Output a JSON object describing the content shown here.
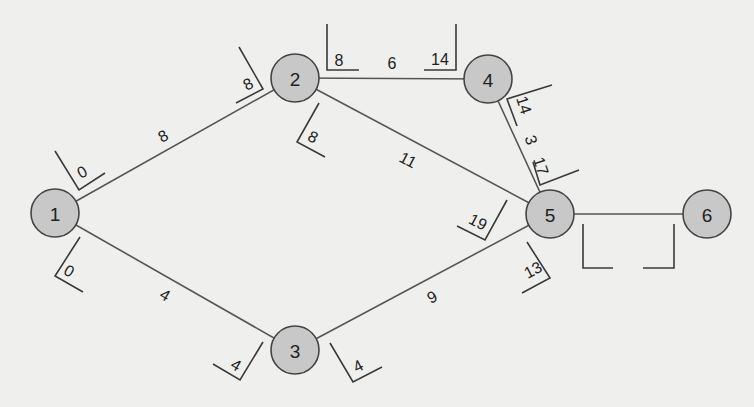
{
  "diagram": {
    "type": "activity-on-node network (critical path)",
    "nodes": [
      {
        "id": "1",
        "label": "1",
        "x": 55,
        "y": 213
      },
      {
        "id": "2",
        "label": "2",
        "x": 295,
        "y": 78
      },
      {
        "id": "3",
        "label": "3",
        "x": 295,
        "y": 350
      },
      {
        "id": "4",
        "label": "4",
        "x": 488,
        "y": 79
      },
      {
        "id": "5",
        "label": "5",
        "x": 550,
        "y": 214
      },
      {
        "id": "6",
        "label": "6",
        "x": 707,
        "y": 214
      }
    ],
    "edges": [
      {
        "from": "1",
        "to": "2",
        "duration": "8",
        "label_x": 163,
        "label_y": 136,
        "rotate": -28
      },
      {
        "from": "1",
        "to": "3",
        "duration": "4",
        "label_x": 165,
        "label_y": 295,
        "rotate": 30
      },
      {
        "from": "2",
        "to": "4",
        "duration": "6",
        "label_x": 392,
        "label_y": 63,
        "rotate": 0
      },
      {
        "from": "2",
        "to": "5",
        "duration": "11",
        "label_x": 408,
        "label_y": 160,
        "rotate": 28
      },
      {
        "from": "3",
        "to": "5",
        "duration": "9",
        "label_x": 432,
        "label_y": 297,
        "rotate": -28
      },
      {
        "from": "4",
        "to": "5",
        "duration": "3",
        "label_x": 531,
        "label_y": 140,
        "rotate": 72
      },
      {
        "from": "5",
        "to": "6",
        "duration": "",
        "label_x": 628,
        "label_y": 200,
        "rotate": 0
      }
    ],
    "time_boxes": [
      {
        "edge": "1-2",
        "end": "start",
        "value": "0",
        "x": 82,
        "y": 172,
        "rotate": -28,
        "path": "55,151 79,190 105,173"
      },
      {
        "edge": "1-2",
        "end": "finish",
        "value": "8",
        "x": 248,
        "y": 84,
        "rotate": -28,
        "path": "239,47 263,89 236,103"
      },
      {
        "edge": "1-3",
        "end": "start",
        "value": "0",
        "x": 69,
        "y": 271,
        "rotate": 30,
        "path": "80,237 55,276 83,292"
      },
      {
        "edge": "1-3",
        "end": "finish",
        "value": "4",
        "x": 236,
        "y": 365,
        "rotate": 30,
        "path": "263,342 240,380 213,364"
      },
      {
        "edge": "2-4",
        "end": "start",
        "value": "8",
        "x": 339,
        "y": 60,
        "rotate": 0,
        "path": "327,24 327,70 359,70"
      },
      {
        "edge": "2-4",
        "end": "finish",
        "value": "14",
        "x": 440,
        "y": 59,
        "rotate": 0,
        "path": "456,24 456,70 424,70"
      },
      {
        "edge": "2-5",
        "end": "start",
        "value": "8",
        "x": 313,
        "y": 137,
        "rotate": 28,
        "path": "319,103 297,142 325,157"
      },
      {
        "edge": "2-5",
        "end": "finish",
        "value": "19",
        "x": 478,
        "y": 222,
        "rotate": 28,
        "path": "507,200 485,240 457,226"
      },
      {
        "edge": "4-5",
        "end": "start",
        "value": "14",
        "x": 524,
        "y": 105,
        "rotate": 72,
        "path": "552,85 507,99 517,126"
      },
      {
        "edge": "4-5",
        "end": "finish",
        "value": "17",
        "x": 541,
        "y": 166,
        "rotate": 72,
        "path": "533,162 540,185 579,170"
      },
      {
        "edge": "3-5",
        "end": "start",
        "value": "4",
        "x": 358,
        "y": 366,
        "rotate": -28,
        "path": "330,343 353,382 382,367"
      },
      {
        "edge": "3-5",
        "end": "finish",
        "value": "13",
        "x": 533,
        "y": 270,
        "rotate": -28,
        "path": "527,242 550,278 522,293"
      },
      {
        "edge": "5-6",
        "end": "start",
        "value": "",
        "x": 598,
        "y": 252,
        "rotate": 0,
        "path": "583,224 583,268 613,268"
      },
      {
        "edge": "5-6",
        "end": "finish",
        "value": "",
        "x": 658,
        "y": 252,
        "rotate": 0,
        "path": "674,224 674,268 643,268"
      }
    ]
  },
  "colors": {
    "background": "#efefed",
    "node_fill": "#c8c8c8",
    "node_stroke": "#444444",
    "line": "#555555",
    "text": "#222222"
  }
}
